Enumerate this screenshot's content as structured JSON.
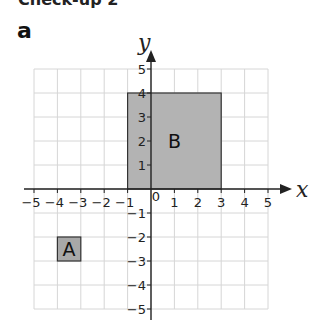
{
  "header": {
    "cut_title": "Check-up 2"
  },
  "part_label": "a",
  "axes": {
    "x_label": "x",
    "y_label": "y",
    "x_ticks": [
      "−5",
      "−4",
      "−3",
      "−2",
      "−1",
      "1",
      "2",
      "3",
      "4",
      "5"
    ],
    "y_ticks": [
      "5",
      "4",
      "3",
      "2",
      "1",
      "−1",
      "−2",
      "−3",
      "−4",
      "−5"
    ],
    "origin_label": "0"
  },
  "shapes": [
    {
      "label": "A",
      "x": [
        -4,
        -3
      ],
      "y": [
        -3,
        -2
      ],
      "fill": "#a8a8a8"
    },
    {
      "label": "B",
      "x": [
        -1,
        3
      ],
      "y": [
        0,
        4
      ],
      "fill": "#b3b3b3"
    }
  ],
  "chart_data": {
    "type": "scatter",
    "title": "",
    "xlabel": "x",
    "ylabel": "y",
    "xlim": [
      -5,
      5
    ],
    "ylim": [
      -5,
      5
    ],
    "grid": true,
    "shapes": [
      {
        "name": "A",
        "kind": "rectangle",
        "vertices": [
          [
            -4,
            -2
          ],
          [
            -3,
            -2
          ],
          [
            -3,
            -3
          ],
          [
            -4,
            -3
          ]
        ]
      },
      {
        "name": "B",
        "kind": "rectangle",
        "vertices": [
          [
            -1,
            4
          ],
          [
            3,
            4
          ],
          [
            3,
            0
          ],
          [
            -1,
            0
          ]
        ]
      }
    ]
  }
}
